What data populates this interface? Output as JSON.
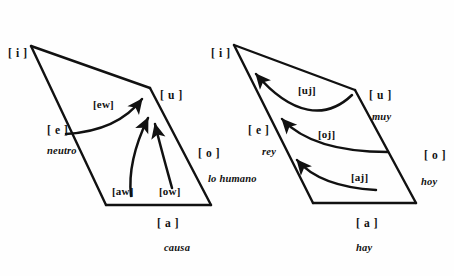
{
  "figure": {
    "kind": "vowel-trapezoid-diphthong-diagram",
    "background_color": "#fefefe",
    "stroke_color": "#111111"
  },
  "left_chart": {
    "name": "falling-diphthongs-toward-u",
    "vowels": [
      {
        "key": "i",
        "label": "[ i ]",
        "x": 8,
        "y": 48
      },
      {
        "key": "e",
        "label": "[ e ]",
        "x": 47,
        "y": 125
      },
      {
        "key": "u",
        "label": "[ u ]",
        "x": 160,
        "y": 90
      },
      {
        "key": "o",
        "label": "[ o ]",
        "x": 198,
        "y": 148
      },
      {
        "key": "a",
        "label": "[ a ]",
        "x": 157,
        "y": 218
      }
    ],
    "diphthongs": [
      {
        "key": "ew",
        "label": "[ew]",
        "x": 93,
        "y": 99
      },
      {
        "key": "aw",
        "label": "[aw]",
        "x": 112,
        "y": 186
      },
      {
        "key": "ow",
        "label": "[ow]",
        "x": 159,
        "y": 186
      }
    ],
    "words": [
      {
        "key": "neutro",
        "label": "neutro",
        "x": 47,
        "y": 146
      },
      {
        "key": "lo-humano",
        "label": "lo humano",
        "x": 208,
        "y": 174
      },
      {
        "key": "causa",
        "label": "causa",
        "x": 164,
        "y": 243
      }
    ]
  },
  "right_chart": {
    "name": "falling-diphthongs-toward-i",
    "vowels": [
      {
        "key": "i",
        "label": "[ i ]",
        "x": 211,
        "y": 48
      },
      {
        "key": "e",
        "label": "[ e ]",
        "x": 248,
        "y": 125
      },
      {
        "key": "u",
        "label": "[ u ]",
        "x": 369,
        "y": 90
      },
      {
        "key": "o",
        "label": "[ o ]",
        "x": 424,
        "y": 150
      },
      {
        "key": "a",
        "label": "[ a ]",
        "x": 356,
        "y": 218
      }
    ],
    "diphthongs": [
      {
        "key": "uj",
        "label": "[uj]",
        "x": 298,
        "y": 85
      },
      {
        "key": "oj",
        "label": "[oj]",
        "x": 318,
        "y": 129
      },
      {
        "key": "aj",
        "label": "[aj]",
        "x": 351,
        "y": 172
      }
    ],
    "words": [
      {
        "key": "muy",
        "label": "muy",
        "x": 372,
        "y": 112
      },
      {
        "key": "rey",
        "label": "rey",
        "x": 262,
        "y": 147
      },
      {
        "key": "hoy",
        "label": "hoy",
        "x": 421,
        "y": 177
      },
      {
        "key": "hay",
        "label": "hay",
        "x": 356,
        "y": 243
      }
    ]
  }
}
